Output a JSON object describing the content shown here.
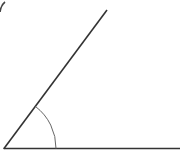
{
  "diagram": {
    "type": "angle",
    "elements": [
      "vertex",
      "horizontal-ray",
      "inclined-ray",
      "angle-arc"
    ],
    "colors": {
      "line": "#333333",
      "arc": "#666666",
      "background": "#ffffff"
    }
  }
}
